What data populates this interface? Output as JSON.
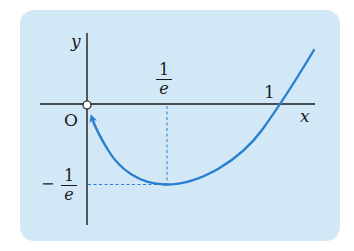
{
  "figure": {
    "function": "y = x ln x",
    "colors": {
      "panel_background": "#d2e8f6",
      "curve": "#2a7fd0",
      "axes": "#1a1a1a",
      "dashed_guides": "#2a7fd0",
      "origin_marker_fill": "#ffffff"
    },
    "axes": {
      "x_label": "x",
      "y_label": "y",
      "origin_label": "O"
    },
    "ticks": {
      "x_min_point": {
        "numerator": "1",
        "denominator": "e"
      },
      "x_root": "1",
      "y_min_value": {
        "sign": "−",
        "numerator": "1",
        "denominator": "e"
      }
    },
    "features": {
      "minimum_point": "(1/e, −1/e)",
      "root": "(1, 0)",
      "open_circle_at": "O (0, 0)",
      "arrow_direction": "curve approaches origin as x → 0+"
    }
  }
}
